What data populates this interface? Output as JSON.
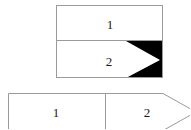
{
  "diagram": {
    "type": "two-table-pointer-diagram",
    "background_color": "#ffffff",
    "stroke_color": "#9a9a9a",
    "fill_color": "#ffffff",
    "marker_color": "#000000",
    "text_color": "#1a1a1a",
    "top_table": {
      "name": "vertical-two-row-table",
      "orientation": "vertical",
      "x": 56,
      "y": 5,
      "width": 107,
      "height": 73,
      "rows": [
        {
          "label": "1",
          "cx": 110,
          "cy": 24
        },
        {
          "label": "2",
          "cx": 109,
          "cy": 61
        }
      ],
      "divider_y": 41,
      "marker": {
        "name": "black-arrow-block",
        "description": "solid black block on right of row 2 with white right-pointing triangle notch",
        "x": 126,
        "y": 41,
        "width": 37,
        "height": 37,
        "triangle_apex_x": 160,
        "triangle_apex_y": 60
      }
    },
    "bottom_table": {
      "name": "horizontal-two-cell-table",
      "orientation": "horizontal",
      "x": 8,
      "y": 93,
      "width": 155,
      "height": 40,
      "divider_x": 105,
      "cells": [
        {
          "label": "1",
          "cx": 56,
          "cy": 112
        },
        {
          "label": "2",
          "cx": 147,
          "cy": 112
        }
      ],
      "right_arrow": {
        "name": "right-edge-arrow-taper",
        "description": "right end tapers to a point beyond the visible canvas edge",
        "apex_x": 196,
        "apex_y": 112
      },
      "cropped": true,
      "cropped_edges": [
        "bottom",
        "right"
      ]
    }
  }
}
